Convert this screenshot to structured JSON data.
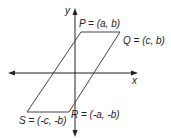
{
  "diagram": {
    "type": "parallelogram on coordinate plane",
    "axes": {
      "x_label": "x",
      "y_label": "y"
    },
    "vertices": [
      {
        "name": "P",
        "label": "P = (a, b)"
      },
      {
        "name": "Q",
        "label": "Q = (c, b)"
      },
      {
        "name": "R",
        "label": "R = (-a, -b)"
      },
      {
        "name": "S",
        "label": "S = (-c, -b)"
      }
    ],
    "colors": {
      "line": "#333333",
      "axis": "#222222"
    }
  }
}
